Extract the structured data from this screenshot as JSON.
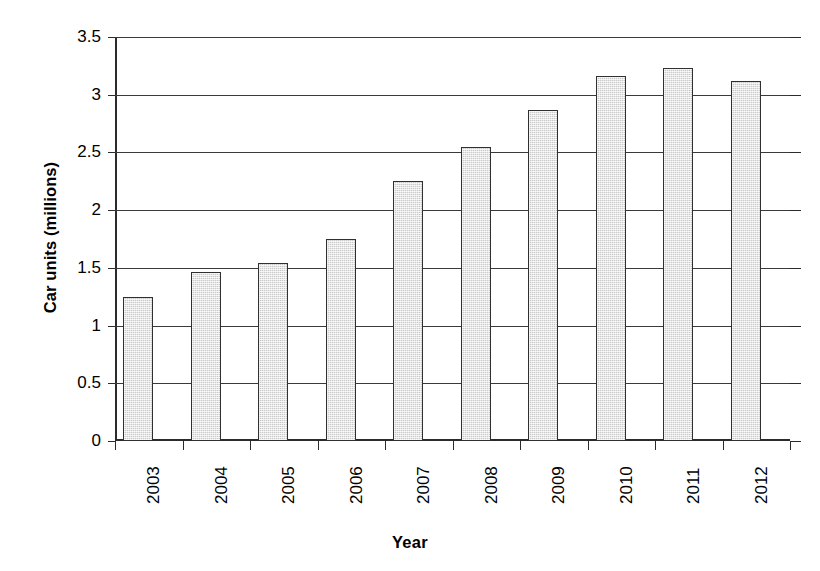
{
  "chart_data": {
    "type": "bar",
    "title": "",
    "xlabel": "Year",
    "ylabel": "Car units (millions)",
    "categories": [
      "2003",
      "2004",
      "2005",
      "2006",
      "2007",
      "2008",
      "2009",
      "2010",
      "2011",
      "2012"
    ],
    "values": [
      1.25,
      1.46,
      1.54,
      1.75,
      2.25,
      2.55,
      2.87,
      3.16,
      3.23,
      3.12
    ],
    "series": [
      {
        "name": "Car units",
        "values": [
          1.25,
          1.46,
          1.54,
          1.75,
          2.25,
          2.55,
          2.87,
          3.16,
          3.23,
          3.12
        ]
      }
    ],
    "ylim": [
      0,
      3.5
    ],
    "ytick_values": [
      0,
      0.5,
      1,
      1.5,
      2,
      2.5,
      3,
      3.5
    ],
    "ytick_labels": [
      "0",
      "0.5",
      "1",
      "1.5",
      "2",
      "2.5",
      "3",
      "3.5"
    ],
    "grid": "horizontal",
    "legend": "none",
    "bar_fill_color": "#c9c9c9",
    "bar_border_color": "#303030",
    "axis_color": "#2b2b2b",
    "background_color": "#ffffff",
    "xtick_label_rotation": 90
  },
  "axes": {
    "y_title": "Car units (millions)",
    "x_title": "Year"
  }
}
